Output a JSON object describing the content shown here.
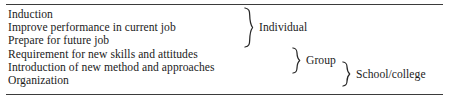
{
  "document": {
    "top_rule": "horizontal-rule",
    "bottom_rule": "horizontal-rule",
    "items": [
      "Induction",
      "Improve performance in current job",
      "Prepare for future job",
      "Requirement for new skills and attitudes",
      "Introduction of new method and approaches",
      "Organization"
    ],
    "groups": [
      {
        "label": "Individual",
        "brace": "curly-brace-right",
        "covers": [
          0,
          1,
          2
        ]
      },
      {
        "label": "Group",
        "brace": "curly-brace-right",
        "covers": [
          3,
          4
        ]
      },
      {
        "label": "School/college",
        "brace": "curly-brace-right",
        "covers": [
          4,
          5
        ]
      }
    ]
  },
  "colors": {
    "text": "#1b1b1b",
    "rule": "#3b3b3b",
    "brace": "#262626",
    "background": "#ffffff"
  }
}
